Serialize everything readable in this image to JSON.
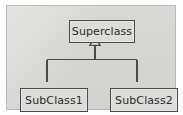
{
  "diagram": {
    "kind": "uml-class-generalization",
    "panel": {
      "background_color": "#d8d8d6",
      "border_color": "#b9b9b7"
    },
    "style": {
      "box_fill": "#dcdcda",
      "box_border": "#4a4a48",
      "line_color": "#4a4a48",
      "text_color": "#2b2b2b",
      "arrowhead": "hollow-triangle"
    },
    "nodes": [
      {
        "id": "superclass",
        "label": "Superclass",
        "role": "parent"
      },
      {
        "id": "subclass1",
        "label": "SubClass1",
        "role": "child"
      },
      {
        "id": "subclass2",
        "label": "SubClass2",
        "role": "child"
      }
    ],
    "edges": [
      {
        "from": "subclass1",
        "to": "superclass",
        "type": "generalization"
      },
      {
        "from": "subclass2",
        "to": "superclass",
        "type": "generalization"
      }
    ]
  }
}
